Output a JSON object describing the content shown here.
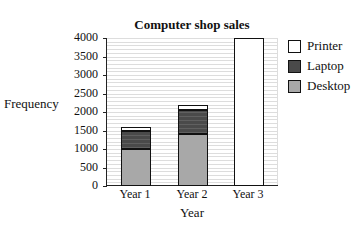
{
  "chart_data": {
    "type": "bar",
    "stacked": true,
    "title": "Computer shop sales",
    "xlabel": "Year",
    "ylabel": "Frequency",
    "categories": [
      "Year 1",
      "Year 2",
      "Year 3"
    ],
    "series": [
      {
        "name": "Desktop",
        "color": "#a8a8a8",
        "values": [
          1000,
          1400,
          0
        ]
      },
      {
        "name": "Laptop",
        "color": "#4a4a4a",
        "values": [
          500,
          650,
          0
        ]
      },
      {
        "name": "Printer",
        "color": "#ffffff",
        "values": [
          100,
          150,
          4000
        ]
      }
    ],
    "totals": [
      1600,
      2200,
      4000
    ],
    "ylim": [
      0,
      4000
    ],
    "yticks": [
      0,
      500,
      1000,
      1500,
      2000,
      2500,
      3000,
      3500,
      4000
    ],
    "grid": true,
    "legend_position": "right",
    "legend": [
      "Printer",
      "Laptop",
      "Desktop"
    ]
  }
}
